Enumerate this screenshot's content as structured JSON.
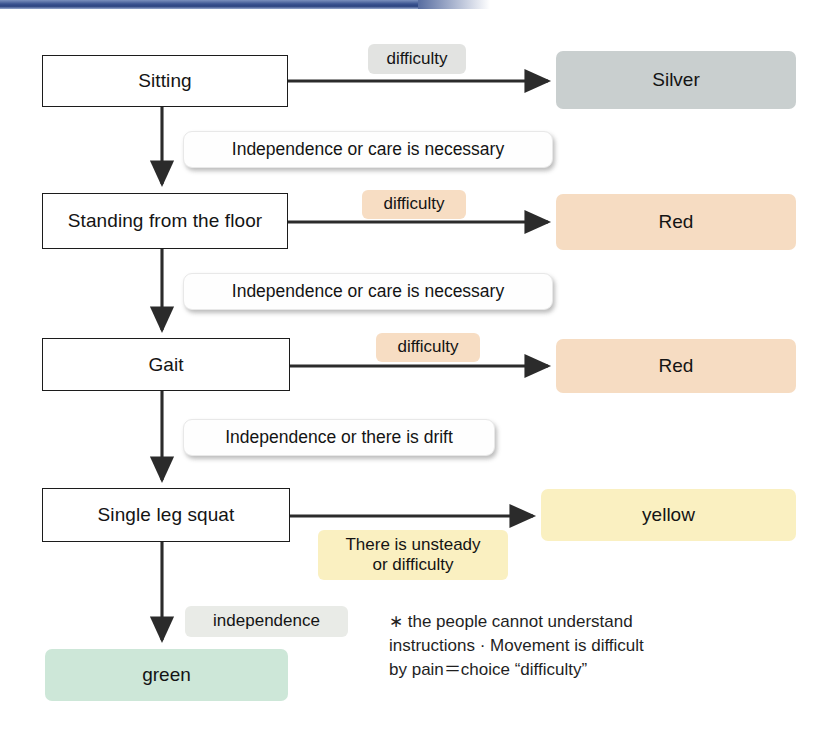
{
  "page": {
    "background_color": "#ffffff",
    "topbar_color": "#3a5390"
  },
  "colors": {
    "silver": "#c9cfcf",
    "red": "#f6dcc2",
    "yellow": "#faf0c1",
    "green": "#cde7d8",
    "tag_gray": "#e2e3e1",
    "tag_peach": "#f7ddc3",
    "tag_yellow": "#faf0c1",
    "box_border": "#1c1c1c",
    "arrow": "#2b2b2b"
  },
  "steps": [
    {
      "id": "sitting",
      "label": "Sitting"
    },
    {
      "id": "standing-from-the-floor",
      "label": "Standing from the floor"
    },
    {
      "id": "gait",
      "label": "Gait"
    },
    {
      "id": "single-leg-squat",
      "label": "Single leg squat"
    }
  ],
  "results": [
    {
      "id": "silver",
      "label": "Silver"
    },
    {
      "id": "red-1",
      "label": "Red"
    },
    {
      "id": "red-2",
      "label": "Red"
    },
    {
      "id": "yellow",
      "label": "yellow"
    },
    {
      "id": "green",
      "label": "green"
    }
  ],
  "branch_tags": [
    {
      "id": "difficulty-1",
      "label": "difficulty"
    },
    {
      "id": "difficulty-2",
      "label": "difficulty"
    },
    {
      "id": "difficulty-3",
      "label": "difficulty"
    },
    {
      "id": "unsteady-or-difficulty",
      "label": "There is unsteady\nor difficulty"
    },
    {
      "id": "independence",
      "label": "independence"
    }
  ],
  "conditions": [
    {
      "id": "independence-or-care-1",
      "label": "Independence or care is necessary"
    },
    {
      "id": "independence-or-care-2",
      "label": "Independence or care is necessary"
    },
    {
      "id": "independence-or-drift",
      "label": "Independence or there is drift"
    }
  ],
  "footnote": {
    "text": "∗ the people cannot understand\ninstructions · Movement is difficult\nby pain＝choice “difficulty”"
  }
}
